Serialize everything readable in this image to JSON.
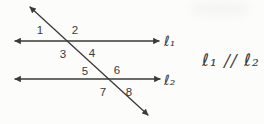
{
  "colors": {
    "background": "#fcfcfb",
    "ink": "#3a3a3a"
  },
  "diagram": {
    "lines": [
      {
        "name": "line-l1",
        "x1": 15,
        "y1": 41,
        "x2": 159,
        "y2": 41
      },
      {
        "name": "line-l2",
        "x1": 15,
        "y1": 79,
        "x2": 160,
        "y2": 79
      },
      {
        "name": "transversal-line",
        "x1": 30,
        "y1": 7,
        "x2": 148,
        "y2": 115
      }
    ],
    "angle_labels": [
      {
        "text": "1",
        "x": 40,
        "y": 34
      },
      {
        "text": "2",
        "x": 75,
        "y": 34
      },
      {
        "text": "3",
        "x": 63,
        "y": 58
      },
      {
        "text": "4",
        "x": 92,
        "y": 57
      },
      {
        "text": "5",
        "x": 85,
        "y": 75
      },
      {
        "text": "6",
        "x": 117,
        "y": 74
      },
      {
        "text": "7",
        "x": 103,
        "y": 96
      },
      {
        "text": "8",
        "x": 129,
        "y": 96
      }
    ],
    "line_labels": [
      {
        "name": "label-l1",
        "text": "ℓ₁",
        "x": 164,
        "y": 46
      },
      {
        "name": "label-l2",
        "text": "ℓ₂",
        "x": 164,
        "y": 85
      }
    ]
  },
  "statement": {
    "text": "ℓ₁ // ℓ₂"
  }
}
